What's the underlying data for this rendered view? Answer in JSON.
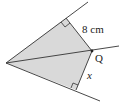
{
  "diagram": {
    "labels": {
      "distance": "8 cm",
      "point": "Q",
      "unknown": "x"
    },
    "colors": {
      "shade": "#d9d9d9",
      "line": "#333333"
    }
  }
}
